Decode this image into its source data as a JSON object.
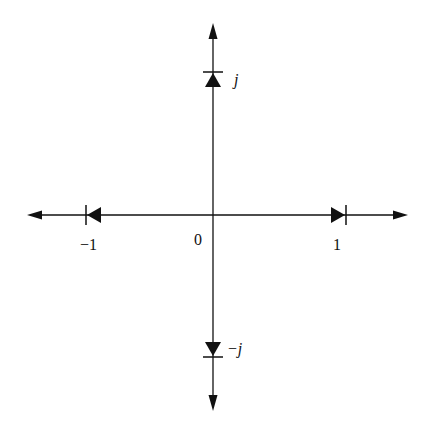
{
  "diagram": {
    "colors": {
      "stroke": "#111111",
      "background": "#ffffff"
    },
    "origin_label": "0",
    "labels": {
      "pos_real": "1",
      "neg_real": "−1",
      "pos_imag": "j",
      "neg_imag": "−j"
    },
    "diodes": [
      {
        "position": "j",
        "direction": "up"
      },
      {
        "position": "-j",
        "direction": "down"
      },
      {
        "position": "1",
        "direction": "right"
      },
      {
        "position": "-1",
        "direction": "left"
      }
    ]
  }
}
